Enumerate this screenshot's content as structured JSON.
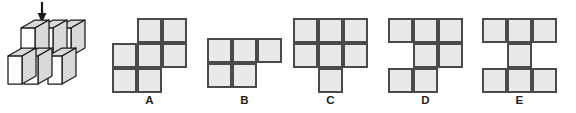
{
  "figure": {
    "name": "isometric-cube-stack",
    "arrow": {
      "name": "down-arrow",
      "direction": "down",
      "label": ""
    }
  },
  "options": [
    {
      "id": "A",
      "label": "A",
      "left": 104,
      "grid_left": 8,
      "grid_top": 18,
      "cells": [
        {
          "r": 0,
          "c": 1
        },
        {
          "r": 0,
          "c": 2
        },
        {
          "r": 1,
          "c": 0
        },
        {
          "r": 1,
          "c": 1
        },
        {
          "r": 1,
          "c": 2
        },
        {
          "r": 2,
          "c": 0
        },
        {
          "r": 2,
          "c": 1
        }
      ],
      "rows": 3,
      "cols": 3
    },
    {
      "id": "B",
      "label": "B",
      "left": 197,
      "grid_left": 10,
      "grid_top": 38,
      "cells": [
        {
          "r": 0,
          "c": 0
        },
        {
          "r": 0,
          "c": 1
        },
        {
          "r": 0,
          "c": 2
        },
        {
          "r": 1,
          "c": 0
        },
        {
          "r": 1,
          "c": 1
        }
      ],
      "rows": 2,
      "cols": 3
    },
    {
      "id": "C",
      "label": "C",
      "left": 283,
      "grid_left": 10,
      "grid_top": 18,
      "cells": [
        {
          "r": 0,
          "c": 0
        },
        {
          "r": 0,
          "c": 1
        },
        {
          "r": 0,
          "c": 2
        },
        {
          "r": 1,
          "c": 0
        },
        {
          "r": 1,
          "c": 1
        },
        {
          "r": 1,
          "c": 2
        },
        {
          "r": 2,
          "c": 1
        }
      ],
      "rows": 3,
      "cols": 3
    },
    {
      "id": "D",
      "label": "D",
      "left": 378,
      "grid_left": 10,
      "grid_top": 18,
      "cells": [
        {
          "r": 0,
          "c": 0
        },
        {
          "r": 0,
          "c": 1
        },
        {
          "r": 0,
          "c": 2
        },
        {
          "r": 1,
          "c": 1
        },
        {
          "r": 1,
          "c": 2
        },
        {
          "r": 2,
          "c": 0
        },
        {
          "r": 2,
          "c": 1
        }
      ],
      "rows": 3,
      "cols": 3
    },
    {
      "id": "E",
      "label": "E",
      "left": 472,
      "grid_left": 10,
      "grid_top": 18,
      "cells": [
        {
          "r": 0,
          "c": 0
        },
        {
          "r": 0,
          "c": 1
        },
        {
          "r": 0,
          "c": 2
        },
        {
          "r": 1,
          "c": 1
        },
        {
          "r": 2,
          "c": 0
        },
        {
          "r": 2,
          "c": 1
        },
        {
          "r": 2,
          "c": 2
        }
      ],
      "rows": 3,
      "cols": 3
    }
  ],
  "colors": {
    "cell_fill": "#e9e9e9",
    "cell_stroke": "#4a4a4a",
    "cube_face": "#ffffff",
    "cube_top": "#d9d9d9",
    "cube_stroke": "#1a1a1a",
    "label_text": "#231f20",
    "background": "#ffffff"
  },
  "layout": {
    "cell_size": 25,
    "label_top": 94
  }
}
